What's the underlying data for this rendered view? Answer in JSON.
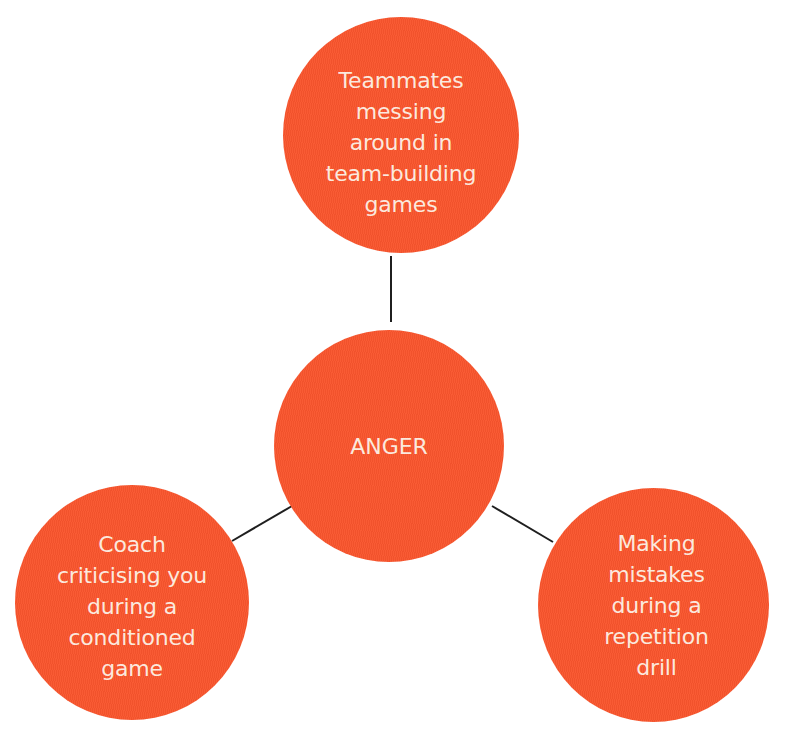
{
  "diagram": {
    "type": "hub-and-spoke",
    "colors": {
      "node_fill": "#f9552d",
      "node_text": "#fbe9de",
      "connector": "#1f1f1f",
      "background": "#ffffff"
    },
    "center": {
      "label": "ANGER"
    },
    "nodes": [
      {
        "position": "top",
        "label": "Teammates\nmessing\naround in\nteam-building\ngames"
      },
      {
        "position": "bottom-left",
        "label": "Coach\ncriticising you\nduring a\nconditioned\ngame"
      },
      {
        "position": "bottom-right",
        "label": "Making\nmistakes\nduring a\nrepetition\ndrill"
      }
    ],
    "edges": [
      {
        "from": "ANGER",
        "to": "top"
      },
      {
        "from": "ANGER",
        "to": "bottom-left"
      },
      {
        "from": "ANGER",
        "to": "bottom-right"
      }
    ]
  }
}
